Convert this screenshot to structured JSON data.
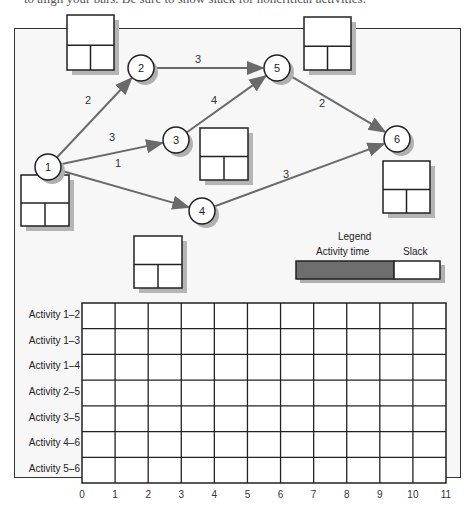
{
  "header": {
    "cut_off_text": "to align your bars. Be sure to show slack for noncritical activities."
  },
  "network": {
    "nodes": [
      {
        "id": "1",
        "x": 48,
        "y": 167
      },
      {
        "id": "2",
        "x": 141,
        "y": 68
      },
      {
        "id": "3",
        "x": 176,
        "y": 140
      },
      {
        "id": "4",
        "x": 202,
        "y": 211
      },
      {
        "id": "5",
        "x": 277,
        "y": 68
      },
      {
        "id": "6",
        "x": 397,
        "y": 139
      }
    ],
    "edges": [
      {
        "from": "1",
        "to": "2",
        "duration": "2",
        "label_x": 88,
        "label_y": 104
      },
      {
        "from": "1",
        "to": "3",
        "duration": "3",
        "label_x": 112,
        "label_y": 141
      },
      {
        "from": "1",
        "to": "4",
        "duration": "1",
        "label_x": 118,
        "label_y": 167
      },
      {
        "from": "2",
        "to": "5",
        "duration": "3",
        "label_x": 198,
        "label_y": 63
      },
      {
        "from": "3",
        "to": "5",
        "duration": "4",
        "label_x": 214,
        "label_y": 104
      },
      {
        "from": "5",
        "to": "6",
        "duration": "2",
        "label_x": 322,
        "label_y": 107
      },
      {
        "from": "4",
        "to": "6",
        "duration": "3",
        "label_x": 286,
        "label_y": 178
      }
    ],
    "time_boxes": [
      {
        "x": 67,
        "y": 15,
        "w": 47,
        "h": 55
      },
      {
        "x": 304,
        "y": 17,
        "w": 47,
        "h": 53
      },
      {
        "x": 200,
        "y": 128,
        "w": 48,
        "h": 52
      },
      {
        "x": 383,
        "y": 161,
        "w": 47,
        "h": 52
      },
      {
        "x": 21,
        "y": 175,
        "w": 48,
        "h": 51
      },
      {
        "x": 134,
        "y": 236,
        "w": 48,
        "h": 52
      }
    ]
  },
  "legend": {
    "title": "Legend",
    "activity_label": "Activity time",
    "slack_label": "Slack",
    "activity_color": "#6e6e6e",
    "slack_color": "#ffffff"
  },
  "gantt": {
    "rows": [
      "Activity 1–2",
      "Activity 1–3",
      "Activity 1–4",
      "Activity 2–5",
      "Activity 3–5",
      "Activity 4–6",
      "Activity 5–6"
    ],
    "ticks": [
      "0",
      "1",
      "2",
      "3",
      "4",
      "5",
      "6",
      "7",
      "8",
      "9",
      "10",
      "11"
    ]
  }
}
